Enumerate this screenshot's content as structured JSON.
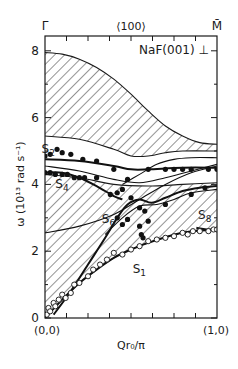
{
  "chart_data": {
    "type": "line",
    "title": "NaF(001) ⊥",
    "direction_label": "⟨100⟩",
    "xlabel": "Qr₀/π",
    "ylabel": "ω (10¹³ rad s⁻¹)",
    "x_tick_labels": {
      "left": "(0,0)",
      "right": "(1,0)"
    },
    "symmetry_points": {
      "left": "Γ̄",
      "right": "M̄"
    },
    "xlim": [
      0,
      1
    ],
    "ylim": [
      0,
      8
    ],
    "y_ticks": [
      0,
      2,
      4,
      6,
      8
    ],
    "y_tick_labels": [
      "0",
      "2",
      "4",
      "6",
      "8"
    ],
    "grid": false,
    "legend": null,
    "bulk_bands": [
      {
        "name": "upper bulk band",
        "upper": {
          "x": [
            0,
            0.1,
            0.2,
            0.3,
            0.4,
            0.5,
            0.6,
            0.7,
            0.8,
            0.9,
            1.0
          ],
          "y": [
            7.95,
            7.9,
            7.75,
            7.5,
            7.15,
            6.7,
            6.2,
            5.75,
            5.45,
            5.25,
            5.2
          ]
        },
        "lower": {
          "x": [
            0,
            0.2,
            0.4,
            0.5,
            0.6,
            0.7,
            0.8,
            1.0
          ],
          "y": [
            5.45,
            5.35,
            5.05,
            4.85,
            4.85,
            4.95,
            5.0,
            5.0
          ]
        }
      },
      {
        "name": "lower bulk band",
        "upper": {
          "x": [
            0,
            0.2,
            0.4,
            0.6,
            0.8,
            1.0
          ],
          "y": [
            4.3,
            4.2,
            4.0,
            3.95,
            4.0,
            4.05
          ]
        },
        "lower": {
          "x": [
            0,
            0.1,
            0.2,
            0.3,
            0.4,
            0.5,
            0.6,
            0.7,
            0.8,
            0.9,
            1.0
          ],
          "y": [
            0,
            0.55,
            1.05,
            1.45,
            1.8,
            2.05,
            2.25,
            2.42,
            2.55,
            2.62,
            2.65
          ]
        }
      }
    ],
    "series": [
      {
        "name": "S1",
        "style": "solid-thick",
        "x": [
          0,
          0.1,
          0.2,
          0.3,
          0.4,
          0.5,
          0.6,
          0.7,
          0.8,
          0.9,
          1.0
        ],
        "y": [
          0,
          0.55,
          1.05,
          1.45,
          1.8,
          2.05,
          2.25,
          2.42,
          2.55,
          2.62,
          2.65
        ]
      },
      {
        "name": "S2",
        "style": "solid-thick",
        "x": [
          0,
          0.2,
          0.4,
          0.5,
          0.6,
          0.8,
          1.0
        ],
        "y": [
          4.75,
          4.7,
          4.55,
          4.45,
          4.45,
          4.5,
          4.5
        ]
      },
      {
        "name": "S4",
        "style": "solid-thick",
        "x": [
          0,
          0.1,
          0.2,
          0.3,
          0.4,
          0.45
        ],
        "y": [
          4.35,
          4.35,
          4.2,
          3.95,
          3.65,
          3.55
        ]
      },
      {
        "name": "S6",
        "style": "solid-thick",
        "x": [
          0.05,
          0.15,
          0.25,
          0.35,
          0.42,
          0.48,
          0.55,
          0.62,
          0.7,
          0.8,
          0.9,
          1.0
        ],
        "y": [
          0.1,
          0.8,
          1.6,
          2.4,
          3.0,
          3.4,
          3.55,
          3.45,
          3.6,
          3.8,
          3.9,
          3.95
        ]
      },
      {
        "name": "S8",
        "style": "solid-thick",
        "x": [
          0.88,
          0.94,
          1.0
        ],
        "y": [
          2.7,
          2.65,
          2.65
        ]
      },
      {
        "name": "bulk-edge-1",
        "style": "solid-thin",
        "x": [
          0,
          0.2,
          0.4,
          0.55,
          0.7,
          0.85,
          1.0
        ],
        "y": [
          2.55,
          2.75,
          3.1,
          3.55,
          4.0,
          4.35,
          4.55
        ]
      },
      {
        "name": "bulk-edge-2",
        "style": "solid-thin",
        "x": [
          0,
          0.2,
          0.4,
          0.55,
          0.7,
          0.85,
          1.0
        ],
        "y": [
          4.55,
          4.4,
          4.15,
          4.05,
          4.2,
          4.4,
          4.6
        ]
      },
      {
        "name": "bulk-edge-3",
        "style": "solid-thin",
        "x": [
          0.45,
          0.55,
          0.65,
          0.75,
          0.85,
          1.0
        ],
        "y": [
          4.0,
          4.3,
          4.6,
          4.75,
          4.8,
          4.8
        ]
      },
      {
        "name": "bulk-edge-4",
        "style": "solid-thin",
        "x": [
          0.35,
          0.45,
          0.55,
          0.65,
          0.75,
          0.85,
          1.0
        ],
        "y": [
          2.5,
          3.0,
          3.35,
          3.4,
          3.55,
          3.75,
          3.85
        ]
      }
    ],
    "measured_points": {
      "filled": {
        "x": [
          0.0,
          0.03,
          0.07,
          0.1,
          0.15,
          0.22,
          0.3,
          0.4,
          0.48,
          0.6,
          0.7,
          0.75,
          0.8,
          0.85,
          0.95,
          1.0,
          0.0,
          0.03,
          0.06,
          0.1,
          0.13,
          0.17,
          0.2,
          0.23,
          0.3,
          0.38,
          0.42,
          0.45,
          0.5,
          0.55,
          0.58,
          0.42,
          0.45,
          0.48,
          0.55,
          0.56,
          0.57,
          0.6,
          0.7,
          0.85,
          0.93
        ],
        "y": [
          4.85,
          4.9,
          5.05,
          4.95,
          4.9,
          4.75,
          4.7,
          4.45,
          4.15,
          4.45,
          4.45,
          4.45,
          4.45,
          4.45,
          4.45,
          4.45,
          4.35,
          4.35,
          4.3,
          4.3,
          4.3,
          4.2,
          4.2,
          4.2,
          4.2,
          3.7,
          3.75,
          3.85,
          3.6,
          3.3,
          3.2,
          3.0,
          2.8,
          2.95,
          2.75,
          2.5,
          2.4,
          2.9,
          3.4,
          3.7,
          3.9
        ]
      },
      "open": {
        "x": [
          0.01,
          0.02,
          0.03,
          0.05,
          0.06,
          0.08,
          0.1,
          0.12,
          0.15,
          0.17,
          0.2,
          0.25,
          0.28,
          0.32,
          0.36,
          0.4,
          0.45,
          0.5,
          0.55,
          0.6,
          0.65,
          0.7,
          0.75,
          0.8,
          0.83,
          0.86,
          0.9,
          0.95,
          0.98,
          1.0
        ],
        "y": [
          0.1,
          0.3,
          0.2,
          0.45,
          0.35,
          0.55,
          0.7,
          0.6,
          0.75,
          1.0,
          1.05,
          1.25,
          1.45,
          1.6,
          1.75,
          1.95,
          1.9,
          2.05,
          2.15,
          2.3,
          2.35,
          2.4,
          2.45,
          2.55,
          2.5,
          2.6,
          2.6,
          2.6,
          2.65,
          2.65
        ]
      }
    },
    "annotations": [
      {
        "text": "S2",
        "x": -0.02,
        "y": 4.95
      },
      {
        "text": "S4",
        "x": 0.06,
        "y": 3.9
      },
      {
        "text": "S6",
        "x": 0.33,
        "y": 2.85
      },
      {
        "text": "S8",
        "x": 0.89,
        "y": 2.95
      },
      {
        "text": "S1",
        "x": 0.51,
        "y": 1.35
      }
    ]
  }
}
